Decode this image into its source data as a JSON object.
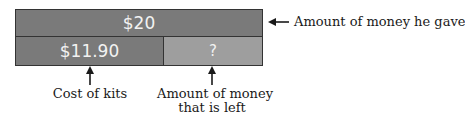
{
  "diagram": {
    "total_bar": {
      "label": "$20",
      "color": "#7a7a7a"
    },
    "part_bar": {
      "label": "$11.90",
      "color": "#7a7a7a"
    },
    "unknown_bar": {
      "label": "?",
      "color": "#9e9e9e"
    },
    "annotations": {
      "total": "Amount of money he gave",
      "part": "Cost of kits",
      "unknown_line1": "Amount of money",
      "unknown_line2": "that is left"
    }
  }
}
